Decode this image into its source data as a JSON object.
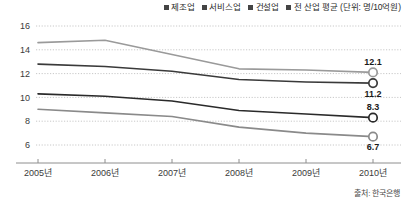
{
  "chart_data": {
    "type": "line",
    "title": "",
    "subtitle": "",
    "xlabel": "",
    "ylabel": "",
    "unit_note": "(단위: 명/10억원)",
    "categories": [
      "2005년",
      "2006년",
      "2007년",
      "2008년",
      "2009년",
      "2010년"
    ],
    "x_tick_labels": [
      "2005년",
      "2006년",
      "2007년",
      "2008년",
      "2009년",
      "2010년"
    ],
    "y_tick_labels": [
      "16",
      "14",
      "12",
      "10",
      "8",
      "6"
    ],
    "y_ticks": [
      16,
      14,
      12,
      10,
      8,
      6
    ],
    "ylim": [
      5.2,
      16.6
    ],
    "xlim": [
      2005,
      2010
    ],
    "grid": true,
    "grid_style": "dotted-horizontal",
    "legend_position": "top-right",
    "series": [
      {
        "name": "제조업",
        "color": "#2a2a2a",
        "values": [
          10.3,
          10.1,
          9.7,
          8.9,
          8.6,
          8.3
        ],
        "end_label": "8.3",
        "end_marker": true
      },
      {
        "name": "서비스업",
        "color": "#9a9a9a",
        "values": [
          14.6,
          14.8,
          13.6,
          12.4,
          12.3,
          12.1
        ],
        "end_label": "12.1",
        "end_marker": true
      },
      {
        "name": "건설업",
        "color": "#8a8a8a",
        "values": [
          9.0,
          8.7,
          8.4,
          7.5,
          7.0,
          6.7
        ],
        "end_label": "6.7",
        "end_marker": true
      },
      {
        "name": "전 산업 평균",
        "color": "#3a3a3a",
        "values": [
          12.8,
          12.6,
          12.2,
          11.5,
          11.3,
          11.2
        ],
        "end_label": "11.2",
        "end_marker": true
      }
    ],
    "annotations": [
      {
        "text": "12.1",
        "series": "서비스업",
        "x": "2010년",
        "y": 12.1
      },
      {
        "text": "11.2",
        "series": "전 산업 평균",
        "x": "2010년",
        "y": 11.2
      },
      {
        "text": "8.3",
        "series": "제조업",
        "x": "2010년",
        "y": 8.3
      },
      {
        "text": "6.7",
        "series": "건설업",
        "x": "2010년",
        "y": 6.7
      }
    ],
    "source": "출처: 한국은행"
  },
  "legend": {
    "items": [
      {
        "label": "제조업",
        "color": "#2a2a2a"
      },
      {
        "label": "서비스업",
        "color": "#9a9a9a"
      },
      {
        "label": "건설업",
        "color": "#8a8a8a"
      },
      {
        "label": "전 산업 평균 (단위: 명/10억원)",
        "color": "#3a3a3a"
      }
    ]
  },
  "footer": {
    "source": "출처: 한국은행"
  }
}
